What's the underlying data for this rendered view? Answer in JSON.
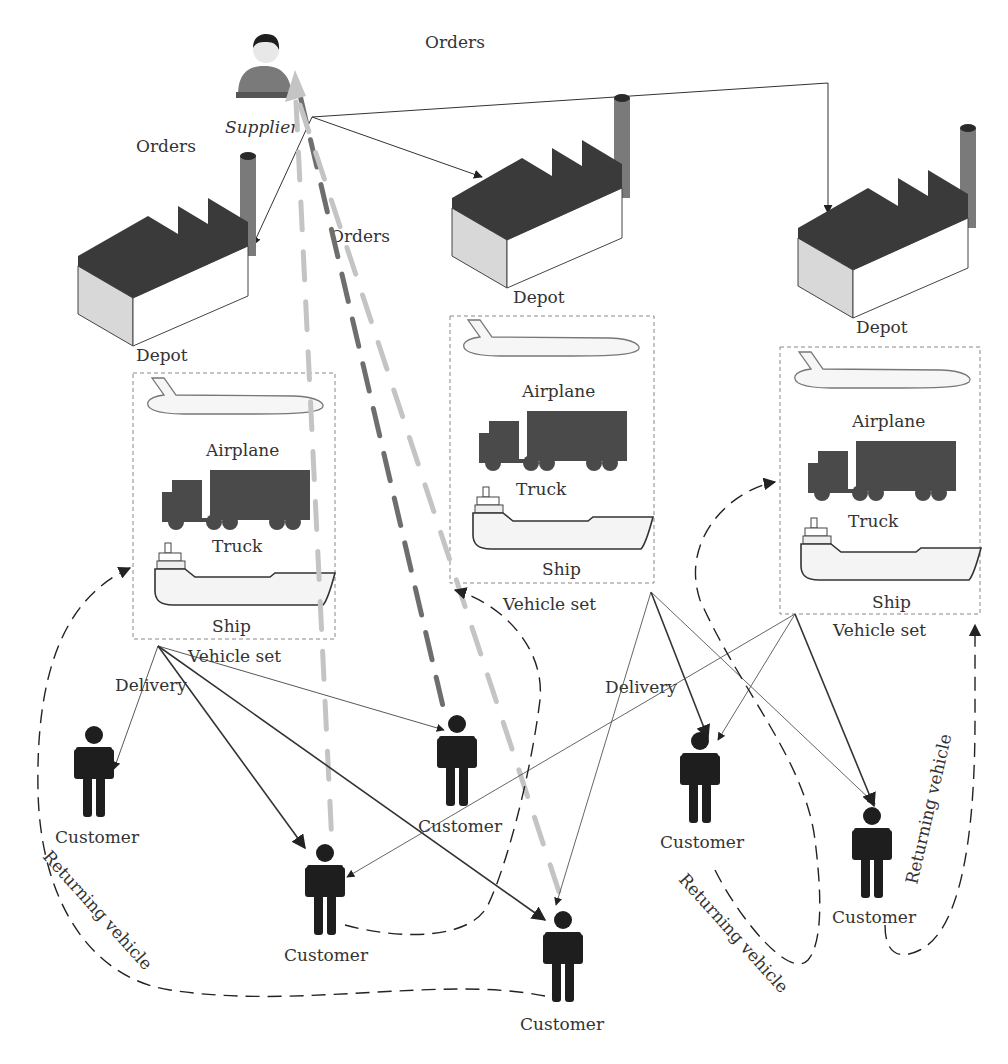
{
  "diagram": {
    "supplier": {
      "label": "Supplier"
    },
    "order_labels": [
      "Orders",
      "Orders",
      "Orders"
    ],
    "depots": [
      {
        "label": "Depot",
        "vehicle_set": {
          "title": "Vehicle set",
          "vehicles": [
            "Airplane",
            "Truck",
            "Ship"
          ]
        }
      },
      {
        "label": "Depot",
        "vehicle_set": {
          "title": "Vehicle set",
          "vehicles": [
            "Airplane",
            "Truck",
            "Ship"
          ]
        }
      },
      {
        "label": "Depot",
        "vehicle_set": {
          "title": "Vehicle set",
          "vehicles": [
            "Airplane",
            "Truck",
            "Ship"
          ]
        }
      }
    ],
    "delivery_labels": [
      "Delivery",
      "Delivery"
    ],
    "customers": [
      "Customer",
      "Customer",
      "Customer",
      "Customer",
      "Customer",
      "Customer",
      "Customer"
    ],
    "returning_labels": [
      "Returning vehicle",
      "Returning vehicle",
      "Returning vehicle"
    ],
    "colors": {
      "roof": "#3a3a3a",
      "chimney": "#7a7a7a",
      "wall_light": "#d8d8d8",
      "truck": "#4a4a4a",
      "customer": "#1e1e1e",
      "order_dash_dark": "#6e6e6e",
      "order_dash_light": "#c4c4c4"
    }
  }
}
